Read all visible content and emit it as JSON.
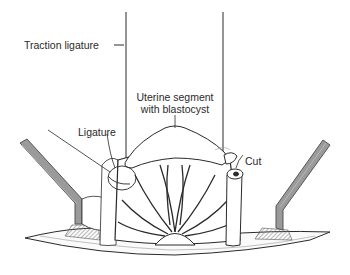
{
  "figure": {
    "type": "surgical illustration",
    "labels": {
      "traction_ligature": "Traction ligature",
      "uterine_segment_line1": "Uterine segment",
      "uterine_segment_line2": "with blastocyst",
      "ligature": "Ligature",
      "cut": "Cut"
    },
    "colors": {
      "line": "#2a2a2a",
      "retractor_fill": "#9a9a9a",
      "retractor_edge": "#555555",
      "hatch": "#8a8a8a",
      "background": "#ffffff"
    }
  }
}
